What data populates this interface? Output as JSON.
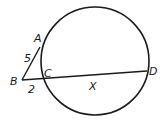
{
  "diagram": {
    "type": "circle-secant-tangent",
    "circle": {
      "cx": 95,
      "cy": 61,
      "r": 54
    },
    "points": {
      "A": {
        "label": "A",
        "x": 40,
        "y": 47
      },
      "B": {
        "label": "B",
        "x": 22,
        "y": 80
      },
      "C": {
        "label": "C",
        "x": 41,
        "y": 78
      },
      "D": {
        "label": "D",
        "x": 147,
        "y": 71
      }
    },
    "segments": [
      {
        "from": "A",
        "to": "B",
        "label": "5"
      },
      {
        "from": "B",
        "to": "C",
        "label": "2"
      },
      {
        "from": "C",
        "to": "D",
        "label": "X"
      }
    ],
    "labels": {
      "A": "A",
      "B": "B",
      "C": "C",
      "D": "D",
      "AB": "5",
      "BC": "2",
      "CD": "X"
    },
    "colors": {
      "stroke": "#1a1a1a",
      "background": "#ffffff"
    }
  }
}
